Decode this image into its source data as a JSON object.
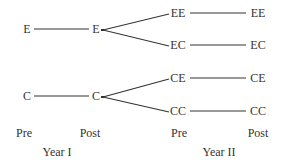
{
  "diagram": {
    "nodes": {
      "e_pre": {
        "label": "E",
        "x": 27,
        "y": 29
      },
      "e_post": {
        "label": "E",
        "x": 96,
        "y": 29
      },
      "c_pre": {
        "label": "C",
        "x": 27,
        "y": 96
      },
      "c_post": {
        "label": "C",
        "x": 96,
        "y": 96
      },
      "ee_pre": {
        "label": "EE",
        "x": 178,
        "y": 13
      },
      "ee_post": {
        "label": "EE",
        "x": 258,
        "y": 13
      },
      "ec_pre": {
        "label": "EC",
        "x": 178,
        "y": 45
      },
      "ec_post": {
        "label": "EC",
        "x": 258,
        "y": 45
      },
      "ce_pre": {
        "label": "CE",
        "x": 178,
        "y": 78
      },
      "ce_post": {
        "label": "CE",
        "x": 258,
        "y": 78
      },
      "cc_pre": {
        "label": "CC",
        "x": 178,
        "y": 111
      },
      "cc_post": {
        "label": "CC",
        "x": 258,
        "y": 111
      }
    },
    "axis_labels": {
      "year1_pre": "Pre",
      "year1_post": "Post",
      "year1": "Year I",
      "year2_pre": "Pre",
      "year2_post": "Post",
      "year2": "Year II"
    },
    "line_color": "#333333"
  }
}
